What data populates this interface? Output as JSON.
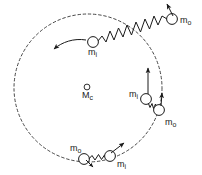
{
  "figure": {
    "stroke_color": "#1a1a1a",
    "background_color": "#ffffff",
    "orbit": {
      "name": "dashed-orbit-circle",
      "center_x": 88,
      "center_y": 88,
      "radius": 74,
      "style": "dashed"
    },
    "center_body": {
      "symbol": "M",
      "subscript": "c",
      "x": 87,
      "y": 87,
      "radius": 3
    },
    "bodies": [
      {
        "id": "upper-left-inner-mass",
        "symbol": "m",
        "subscript": "i",
        "label_x": 88,
        "label_y": 49,
        "cx": 93,
        "cy": 42,
        "r": 5.5
      },
      {
        "id": "top-right-outer-mass",
        "symbol": "m",
        "subscript": "o",
        "label_x": 180,
        "label_y": 17,
        "cx": 172,
        "cy": 19,
        "r": 5.5
      },
      {
        "id": "right-inner-mass",
        "symbol": "m",
        "subscript": "i",
        "label_x": 129,
        "label_y": 90,
        "cx": 146,
        "cy": 99,
        "r": 5.5
      },
      {
        "id": "right-outer-mass",
        "symbol": "m",
        "subscript": "o",
        "label_x": 164,
        "label_y": 120,
        "cx": 159,
        "cy": 110,
        "r": 5.5
      },
      {
        "id": "bottom-outer-mass",
        "symbol": "m",
        "subscript": "o",
        "label_x": 72,
        "label_y": 146,
        "cx": 84,
        "cy": 159,
        "r": 5.5
      },
      {
        "id": "bottom-inner-mass",
        "symbol": "m",
        "subscript": "i",
        "label_x": 115,
        "label_y": 161,
        "cx": 110,
        "cy": 156,
        "r": 5.5
      }
    ],
    "springs": [
      {
        "id": "upper-left-spring",
        "from": "upper-left-inner-mass",
        "to": "top-right-outer-mass"
      },
      {
        "id": "right-spring",
        "from": "right-inner-mass",
        "to": "right-outer-mass"
      },
      {
        "id": "bottom-spring",
        "from": "bottom-outer-mass",
        "to": "bottom-inner-mass"
      }
    ],
    "arrows": [
      {
        "id": "upper-left-velocity-arrow",
        "direction": "left-down",
        "curved": true
      },
      {
        "id": "top-right-velocity-arrow",
        "direction": "up-left",
        "curved": false
      },
      {
        "id": "right-inner-velocity-arrow",
        "direction": "up",
        "curved": false
      },
      {
        "id": "right-outer-velocity-arrow",
        "direction": "up",
        "curved": false
      },
      {
        "id": "bottom-outer-velocity-arrow",
        "direction": "down-right",
        "curved": false
      },
      {
        "id": "bottom-inner-velocity-arrow",
        "direction": "up-right",
        "curved": false
      }
    ]
  }
}
